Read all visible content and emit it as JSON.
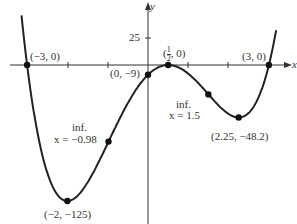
{
  "chart_data": {
    "type": "line",
    "function": "f(x) = (x+3)(x-3)(2x-1)^2",
    "xlabel": "x",
    "ylabel": "y",
    "xlim": [
      -3.6,
      3.7
    ],
    "ylim": [
      -140,
      60
    ],
    "x_ticks": [
      -2,
      -1,
      1,
      2
    ],
    "y_ticks": [
      25
    ],
    "y_tick_labels": [
      "25"
    ],
    "points": [
      {
        "x": -3,
        "y": 0,
        "label": "(−3, 0)"
      },
      {
        "x": 0,
        "y": -9,
        "label": "(0, −9)"
      },
      {
        "x": 0.5,
        "y": 0,
        "label": "(1/2, 0)"
      },
      {
        "x": 3,
        "y": 0,
        "label": "(3, 0)"
      },
      {
        "x": -2,
        "y": -125,
        "label": "(−2, −125)"
      },
      {
        "x": 2.25,
        "y": -48.2,
        "label": "(2.25, −48.2)"
      },
      {
        "x": -0.98,
        "y": -66.5,
        "label": "inf. x = −0.98"
      },
      {
        "x": 1.5,
        "y": -27,
        "label": "inf. x = 1.5"
      }
    ],
    "annotations": {
      "inf_left": [
        "inf.",
        "x = −0.98"
      ],
      "inf_right": [
        "inf.",
        "x = 1.5"
      ]
    },
    "grid": false,
    "legend": null
  },
  "labels": {
    "y_axis": "y",
    "x_axis": "x",
    "tick_25": "25",
    "p_m3": "(−3, 0)",
    "p_0": "(0, −9)",
    "p_half_open": "(",
    "p_half_num": "1",
    "p_half_den": "2",
    "p_half_close": ", 0)",
    "p_3": "(3, 0)",
    "p_min_left": "(−2, −125)",
    "p_min_right": "(2.25, −48.2)",
    "inf_left_1": "inf.",
    "inf_left_2": "x = −0.98",
    "inf_right_1": "inf.",
    "inf_right_2": "x = 1.5"
  }
}
